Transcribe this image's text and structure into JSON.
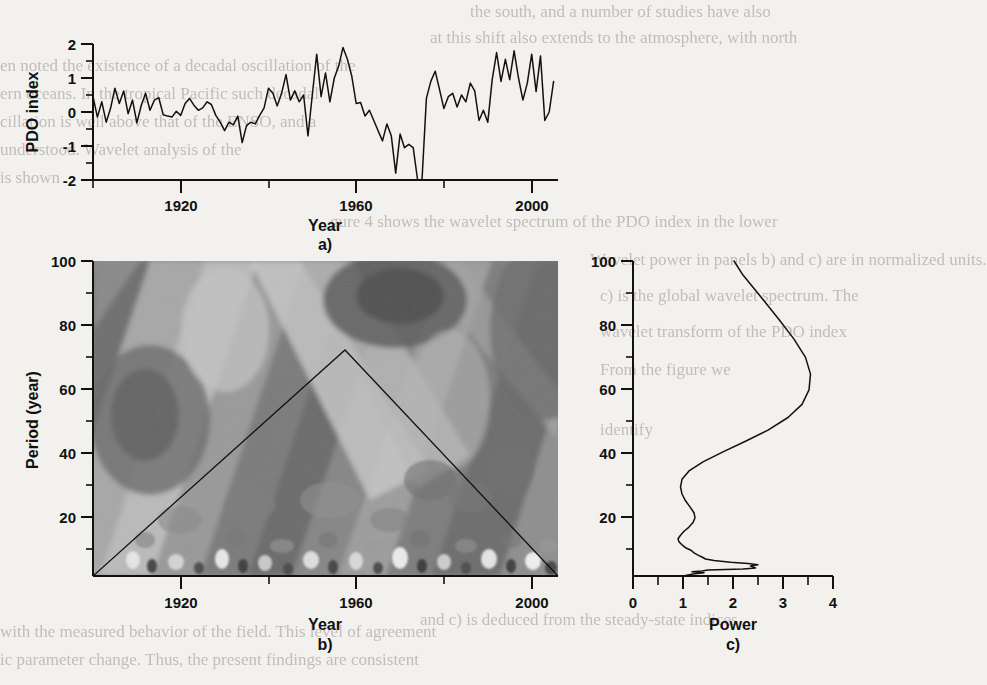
{
  "figure": {
    "panels": [
      {
        "id": "a",
        "label": "a)",
        "ylabel": "PDO index",
        "xlabel": "Year"
      },
      {
        "id": "b",
        "label": "b)",
        "ylabel": "Period (year)",
        "xlabel": "Year"
      },
      {
        "id": "c",
        "label": "c)",
        "ylabel": "Period (year)",
        "xlabel": "Power"
      }
    ]
  },
  "background_text": {
    "lines": [
      "the south, and a number of studies have also",
      "at this shift also extends to the atmosphere, with north",
      "en noted the existence of a decadal oscillation of the",
      "ern oceans. In the tropical Pacific such decadal",
      "cillation is well above that of the ENSO, and a",
      "understood. Wavelet analysis of the",
      "is shown",
      "gure 4 shows the wavelet spectrum of the PDO index in the lower",
      "Wavelet power in panels b) and c) are in normalized units.",
      "c) is the global wavelet spectrum. The",
      "wavelet transform of the PDO index",
      "From the figure we",
      "identify",
      "and c) is deduced from the steady-state indices",
      "with the measured behavior of the field. This level of agreement",
      "ic parameter change. Thus, the present findings are consistent"
    ]
  },
  "chart_data": [
    {
      "type": "line",
      "panel": "a",
      "title": "",
      "xlabel": "Year",
      "ylabel": "PDO index",
      "xlim": [
        1900,
        2006
      ],
      "ylim": [
        -2,
        2
      ],
      "xticks": [
        1920,
        1960,
        2000
      ],
      "xticks_minor": [
        1900,
        1940,
        1980
      ],
      "yticks": [
        -2,
        -1,
        0,
        1,
        2
      ],
      "yticks_minor": [
        -1.5,
        -0.5,
        0.5,
        1.5
      ],
      "grid": false,
      "x": [
        1900,
        1901,
        1902,
        1903,
        1904,
        1905,
        1906,
        1907,
        1908,
        1909,
        1910,
        1911,
        1912,
        1913,
        1914,
        1915,
        1916,
        1917,
        1918,
        1919,
        1920,
        1921,
        1922,
        1923,
        1924,
        1925,
        1926,
        1927,
        1928,
        1929,
        1930,
        1931,
        1932,
        1933,
        1934,
        1935,
        1936,
        1937,
        1938,
        1939,
        1940,
        1941,
        1942,
        1943,
        1944,
        1945,
        1946,
        1947,
        1948,
        1949,
        1950,
        1951,
        1952,
        1953,
        1954,
        1955,
        1956,
        1957,
        1958,
        1959,
        1960,
        1961,
        1962,
        1963,
        1964,
        1965,
        1966,
        1967,
        1968,
        1969,
        1970,
        1971,
        1972,
        1973,
        1974,
        1975,
        1976,
        1977,
        1978,
        1979,
        1980,
        1981,
        1982,
        1983,
        1984,
        1985,
        1986,
        1987,
        1988,
        1989,
        1990,
        1991,
        1992,
        1993,
        1994,
        1995,
        1996,
        1997,
        1998,
        1999,
        2000,
        2001,
        2002,
        2003,
        2004,
        2005
      ],
      "y": [
        0.45,
        -0.15,
        0.3,
        -0.3,
        0.1,
        0.7,
        0.25,
        0.62,
        -0.05,
        0.35,
        -0.32,
        0.2,
        0.55,
        0.05,
        0.35,
        0.42,
        -0.08,
        -0.12,
        -0.15,
        0.02,
        -0.1,
        0.25,
        0.4,
        0.2,
        0.05,
        0.12,
        0.3,
        0.22,
        -0.1,
        -0.3,
        -0.55,
        -0.3,
        -0.38,
        -0.12,
        -0.9,
        -0.4,
        -0.3,
        -0.35,
        -0.1,
        0.12,
        0.7,
        0.55,
        0.18,
        0.55,
        1.1,
        0.35,
        0.62,
        0.3,
        0.5,
        -0.7,
        0.5,
        1.7,
        0.45,
        1.15,
        0.3,
        1.0,
        1.35,
        1.9,
        1.55,
        1.05,
        0.25,
        0.28,
        -0.12,
        0.05,
        -0.25,
        -0.55,
        -0.85,
        -0.35,
        -0.7,
        -1.8,
        -0.65,
        -1.05,
        -0.95,
        -1.05,
        -2.0,
        -2.0,
        0.4,
        0.9,
        1.2,
        0.65,
        0.1,
        0.45,
        0.55,
        0.15,
        0.5,
        0.3,
        0.85,
        0.62,
        -0.25,
        0.05,
        -0.3,
        0.95,
        1.75,
        0.9,
        1.55,
        0.95,
        1.8,
        1.0,
        0.35,
        0.85,
        1.7,
        0.6,
        1.65,
        -0.25,
        0.0,
        0.9
      ]
    },
    {
      "type": "heatmap",
      "panel": "b",
      "title": "",
      "xlabel": "Year",
      "ylabel": "Period (year)",
      "xlim": [
        1900,
        2006
      ],
      "ylim": [
        2,
        100
      ],
      "xticks": [
        1920,
        1960,
        2000
      ],
      "xticks_minor": [
        1900,
        1940,
        1980
      ],
      "yticks": [
        20,
        40,
        60,
        80,
        100
      ],
      "yticks_minor": [
        10,
        30,
        50,
        70,
        90
      ],
      "colormap": "grayscale-contour",
      "description": "Wavelet power spectrum of the PDO index; diagonal banded contour structure with dark high-power ridges, light low-power bands, fine speckled structure at short periods, and a triangular cone-of-influence line peaking near 1953 at period 71.",
      "cone_of_influence": {
        "left_x": 1900,
        "left_y": 2,
        "apex_x": 1953,
        "apex_y": 71,
        "right_x": 2006,
        "right_y": 2
      }
    },
    {
      "type": "line",
      "panel": "c",
      "title": "",
      "xlabel": "Power",
      "ylabel": "Period (year)",
      "xlim": [
        0,
        4
      ],
      "ylim": [
        2,
        100
      ],
      "xticks": [
        0,
        1,
        2,
        3,
        4
      ],
      "xticks_minor": [
        0.5,
        1.5,
        2.5,
        3.5
      ],
      "yticks": [
        20,
        40,
        60,
        80,
        100
      ],
      "yticks_minor": [
        10,
        30,
        50,
        70,
        90
      ],
      "grid": false,
      "orientation": "horizontal-power-vertical-period",
      "period": [
        2.2,
        2.6,
        3.0,
        3.3,
        3.6,
        3.9,
        4.2,
        4.5,
        4.8,
        5.1,
        5.5,
        5.9,
        6.3,
        6.8,
        7.3,
        7.9,
        8.5,
        9.2,
        10.0,
        10.8,
        11.7,
        12.6,
        13.6,
        14.7,
        15.9,
        17.2,
        18.6,
        20.1,
        21.7,
        23.5,
        25.4,
        27.5,
        29.7,
        32.1,
        34.7,
        37.5,
        40.6,
        43.9,
        47.4,
        51.3,
        55.4,
        59.9,
        64.8,
        70.0,
        75.7,
        81.8,
        88.4,
        95.6,
        100.0
      ],
      "power": [
        1.05,
        1.2,
        1.42,
        1.18,
        1.38,
        1.5,
        2.2,
        2.45,
        2.4,
        2.35,
        2.5,
        2.3,
        1.95,
        1.62,
        1.45,
        1.38,
        1.3,
        1.22,
        1.16,
        1.05,
        0.98,
        0.92,
        0.9,
        0.95,
        1.02,
        1.12,
        1.2,
        1.24,
        1.22,
        1.14,
        1.05,
        0.98,
        0.95,
        0.98,
        1.12,
        1.4,
        1.8,
        2.25,
        2.7,
        3.1,
        3.38,
        3.52,
        3.55,
        3.45,
        3.22,
        2.92,
        2.58,
        2.2,
        2.02
      ]
    }
  ]
}
